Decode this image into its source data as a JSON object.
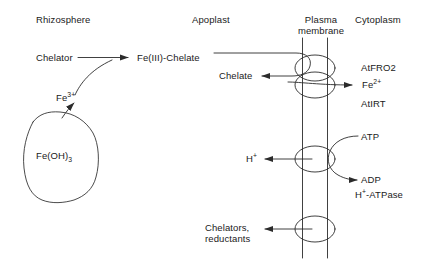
{
  "figure": {
    "type": "biological-pathway-diagram",
    "stroke_color": "#2b2b2b",
    "text_color": "#1a1a1a",
    "background": "#ffffff"
  },
  "headers": [
    {
      "id": "rhizosphere",
      "label": "Rhizosphere"
    },
    {
      "id": "apoplast",
      "label": "Apoplast"
    },
    {
      "id": "plasma-membrane",
      "label_line1": "Plasma",
      "label_line2": "membrane"
    },
    {
      "id": "cytoplasm",
      "label": "Cytoplasm"
    }
  ],
  "labels": {
    "chelator": "Chelator",
    "fe3_base": "Fe",
    "fe3_charge": "3+",
    "fe_oh_3_base": "Fe(OH)",
    "fe_oh_3_sub": "3",
    "fe3_chelate": "Fe(III)-Chelate",
    "chelate": "Chelate",
    "fe2_base": "Fe",
    "fe2_charge": "2+",
    "at_fro2": "AtFRO2",
    "at_irt": "AtIRT",
    "h_plus_base": "H",
    "h_plus_charge": "+",
    "atp": "ATP",
    "adp": "ADP",
    "h_atpase_base": "H",
    "h_atpase_charge": "+",
    "h_atpase_rest": "-ATPase",
    "chelators_line1": "Chelators,",
    "chelators_line2": "reductants"
  },
  "transporters": [
    {
      "id": "atfro2",
      "name": "AtFRO2",
      "role": "ferric-chelate reductase"
    },
    {
      "id": "atirt",
      "name": "AtIRT",
      "role": "Fe(II) transporter"
    },
    {
      "id": "h-atpase",
      "name": "H+-ATPase",
      "role": "proton pump"
    },
    {
      "id": "efflux-carrier",
      "name": "chelator/reductant efflux",
      "role": "efflux"
    }
  ],
  "reactions": [
    {
      "id": "chelation",
      "from": "Chelator",
      "to": "Fe(III)-Chelate",
      "substrate": "Fe3+"
    },
    {
      "id": "dissolution",
      "from": "Fe(OH)3",
      "to": "Fe3+"
    },
    {
      "id": "reduction",
      "from": "Fe(III)-Chelate",
      "to": "Chelate",
      "enzyme": "AtFRO2"
    },
    {
      "id": "fe2-uptake",
      "to": "Fe2+",
      "transporter": "AtIRT"
    },
    {
      "id": "proton-extrusion",
      "to": "H+",
      "transporter": "H+-ATPase",
      "cofactor_in": "ATP",
      "cofactor_out": "ADP"
    },
    {
      "id": "efflux",
      "to": "Chelators, reductants"
    }
  ]
}
